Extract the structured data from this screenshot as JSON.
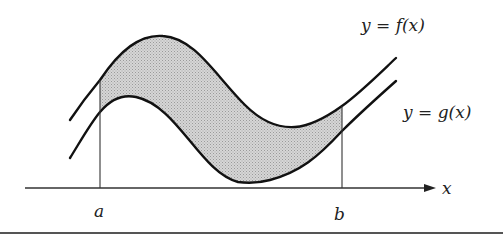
{
  "figure": {
    "type": "area-between-curves",
    "colors": {
      "curve": "#111111",
      "axis": "#333333",
      "shading": "#bdbdbd",
      "background": "#ffffff"
    },
    "labels": {
      "f_curve": "y = f(x)",
      "g_curve": "y = g(x)",
      "x_axis": "x",
      "lower_bound": "a",
      "upper_bound": "b"
    },
    "curves": {
      "f": {
        "name": "f",
        "description": "upper curve: rises to a maximum, dips to a minimum, then rises"
      },
      "g": {
        "name": "g",
        "description": "lower curve: same shape shifted down and left"
      }
    },
    "shaded_region": {
      "from": "a",
      "to": "b",
      "between": [
        "f",
        "g"
      ]
    }
  }
}
